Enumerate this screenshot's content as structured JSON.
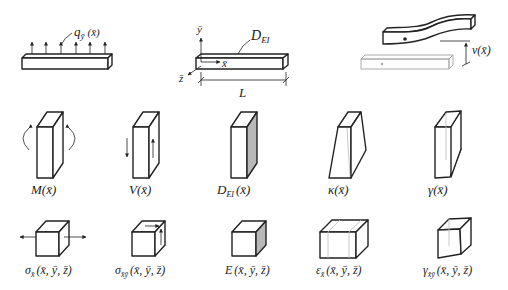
{
  "top_row": {
    "load_label": "q",
    "load_sub": "ȳ",
    "load_arg": "(x̄)",
    "axes": {
      "y": "ȳ",
      "x": "x̄",
      "z": "z̄"
    },
    "rigidity_label": "D",
    "rigidity_sub": "EI",
    "length_label": "L",
    "deflection_label": "v(x̄)"
  },
  "middle_row": {
    "items": [
      {
        "name": "M",
        "sub": "",
        "arg": "(x̄)"
      },
      {
        "name": "V",
        "sub": "",
        "arg": "(x̄)"
      },
      {
        "name": "D",
        "sub": "EI",
        "arg": "(x̄)"
      },
      {
        "name": "κ",
        "sub": "",
        "arg": "(x̄)"
      },
      {
        "name": "γ",
        "sub": "",
        "arg": "(x̄)"
      }
    ]
  },
  "bottom_row": {
    "items": [
      {
        "name": "σ",
        "sub": "x̄",
        "arg": "(x̄, ȳ, z̄)"
      },
      {
        "name": "σ",
        "sub": "x̄ȳ",
        "arg": "(x̄, ȳ, z̄)"
      },
      {
        "name": "E",
        "sub": "",
        "arg": "(x̄, ȳ, z̄)"
      },
      {
        "name": "ε",
        "sub": "x̄",
        "arg": "(x̄, ȳ, z̄)"
      },
      {
        "name": "γ",
        "sub": "x̄ȳ",
        "arg": "(x̄, ȳ, z̄)"
      }
    ]
  }
}
